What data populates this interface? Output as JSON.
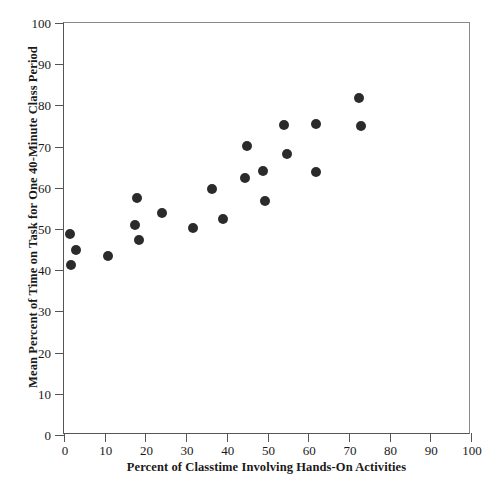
{
  "chart_data": {
    "type": "scatter",
    "title": "",
    "xlabel": "Percent of Classtime Involving Hands-On Activities",
    "ylabel": "Mean Percent of Time on Task for One 40-Minute Class Period",
    "xlim": [
      0,
      100
    ],
    "ylim": [
      0,
      100
    ],
    "xticks": [
      0,
      10,
      20,
      30,
      40,
      50,
      60,
      70,
      80,
      90,
      100
    ],
    "yticks": [
      0,
      10,
      20,
      30,
      40,
      50,
      60,
      70,
      80,
      90,
      100
    ],
    "xtick_labels": [
      "0",
      "10",
      "20",
      "30",
      "40",
      "50",
      "60",
      "70",
      "80",
      "90",
      "100"
    ],
    "ytick_labels": [
      "0",
      "10",
      "20",
      "30",
      "40",
      "50",
      "60",
      "70",
      "80",
      "90",
      "100"
    ],
    "grid": false,
    "legend": null,
    "marker": "filled-circle",
    "marker_color": "#2b2b2b",
    "points": [
      {
        "x": 1.5,
        "y": 48.8
      },
      {
        "x": 3.0,
        "y": 44.8
      },
      {
        "x": 1.8,
        "y": 41.3
      },
      {
        "x": 10.8,
        "y": 43.5
      },
      {
        "x": 18.0,
        "y": 57.5
      },
      {
        "x": 17.5,
        "y": 51.0
      },
      {
        "x": 18.5,
        "y": 47.3
      },
      {
        "x": 24.0,
        "y": 54.0
      },
      {
        "x": 31.8,
        "y": 50.3
      },
      {
        "x": 36.3,
        "y": 59.6
      },
      {
        "x": 39.0,
        "y": 52.5
      },
      {
        "x": 45.0,
        "y": 70.2
      },
      {
        "x": 44.5,
        "y": 62.5
      },
      {
        "x": 48.8,
        "y": 64.0
      },
      {
        "x": 49.5,
        "y": 56.7
      },
      {
        "x": 54.0,
        "y": 75.2
      },
      {
        "x": 54.8,
        "y": 68.3
      },
      {
        "x": 62.0,
        "y": 75.4
      },
      {
        "x": 61.8,
        "y": 63.8
      },
      {
        "x": 72.5,
        "y": 81.8
      },
      {
        "x": 73.0,
        "y": 75.0
      }
    ]
  }
}
